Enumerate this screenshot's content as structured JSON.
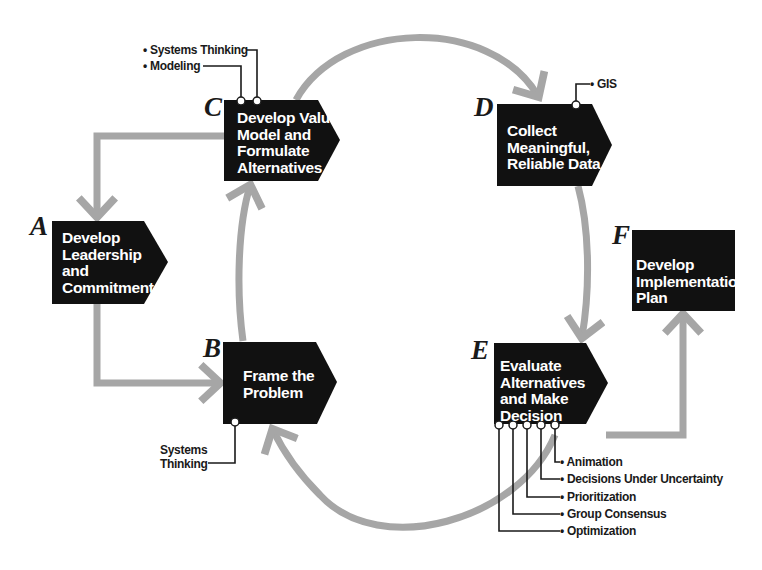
{
  "diagram": {
    "type": "process-cycle",
    "colors": {
      "box_fill": "#111111",
      "box_text": "#ffffff",
      "arrow": "#a6a6a6",
      "connector": "#1a1a1a",
      "letter": "#1a1a1a",
      "background": "#ffffff"
    },
    "steps": [
      {
        "id": "A",
        "letter": "A",
        "lines": [
          "Develop",
          "Leadership",
          "and",
          "Commitment"
        ],
        "tools": []
      },
      {
        "id": "B",
        "letter": "B",
        "lines": [
          "Frame the",
          "Problem"
        ],
        "tools": [
          [
            "Systems",
            "Thinking"
          ]
        ]
      },
      {
        "id": "C",
        "letter": "C",
        "lines": [
          "Develop Value",
          "Model and",
          "Formulate",
          "Alternatives"
        ],
        "tools": [
          "• Systems Thinking",
          "• Modeling"
        ]
      },
      {
        "id": "D",
        "letter": "D",
        "lines": [
          "Collect",
          "Meaningful,",
          "Reliable Data"
        ],
        "tools": [
          "• GIS"
        ]
      },
      {
        "id": "E",
        "letter": "E",
        "lines": [
          "Evaluate",
          "Alternatives",
          "and Make",
          "Decision"
        ],
        "tools": [
          "• Animation",
          "• Decisions Under Uncertainty",
          "• Prioritization",
          "• Group Consensus",
          "• Optimization"
        ]
      },
      {
        "id": "F",
        "letter": "F",
        "lines": [
          "Develop",
          "Implementation",
          "Plan"
        ],
        "tools": []
      }
    ],
    "flows": [
      {
        "from": "C",
        "to": "A"
      },
      {
        "from": "A",
        "to": "B"
      },
      {
        "from": "B",
        "to": "C"
      },
      {
        "from": "C",
        "to": "D"
      },
      {
        "from": "D",
        "to": "E"
      },
      {
        "from": "E",
        "to": "F"
      },
      {
        "from": "E",
        "to": "B"
      }
    ]
  }
}
